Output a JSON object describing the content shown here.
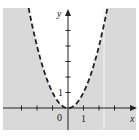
{
  "chart_data": {
    "type": "line",
    "title": "",
    "xlabel": "x",
    "ylabel": "y",
    "series": [
      {
        "name": "y = x^2 (boundary, dashed)",
        "function": "x^2",
        "style": "dashed",
        "x": [
          -2.6,
          -2,
          -1,
          0,
          1,
          2,
          2.6
        ],
        "values": [
          6.76,
          4,
          1,
          0,
          1,
          4,
          6.76
        ]
      }
    ],
    "shaded_region": "y < x^2 (outside the parabola)",
    "xlim": [
      -4.2,
      4.3
    ],
    "ylim": [
      -1.4,
      6.5
    ],
    "x_tick_labels": [
      {
        "value": 0,
        "label": "0"
      },
      {
        "value": 1,
        "label": "1"
      }
    ],
    "y_tick_labels": [
      {
        "value": 1,
        "label": "1"
      }
    ],
    "x_ticks": [
      -3,
      -2,
      -1,
      1,
      2,
      3
    ],
    "y_ticks": [
      1,
      2,
      3,
      4,
      5
    ],
    "grid": false,
    "legend": "none"
  },
  "colors": {
    "shade": "#d9d9d9",
    "curve": "#222222",
    "axis": "#222222"
  },
  "labels": {
    "x_axis": "x",
    "y_axis": "y",
    "origin": "0",
    "x_one": "1",
    "y_one": "1"
  }
}
